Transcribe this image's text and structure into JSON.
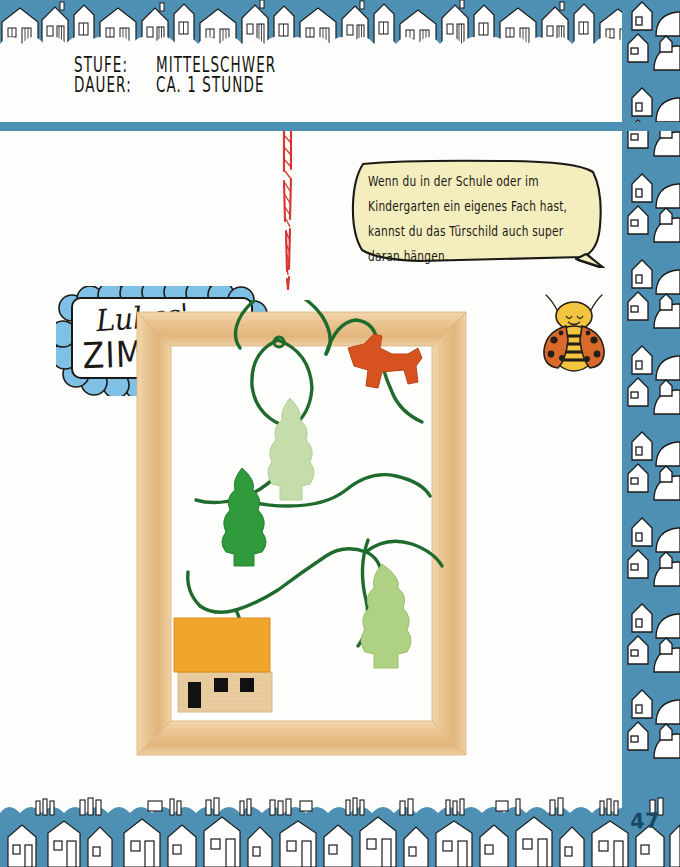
{
  "page": {
    "number": "47",
    "background_color": "#fdfdfb",
    "accent_blue": "#4e90b4",
    "accent_blue_dark": "#184a66"
  },
  "meta": {
    "rows": [
      {
        "label": "STUFE:",
        "value": "MITTELSCHWER"
      },
      {
        "label": "DAUER:",
        "value": "CA. 1 STUNDE"
      }
    ]
  },
  "speech_bubble": {
    "text": "Wenn du in der Schule oder im Kindergarten ein eigenes Fach hast, kannst du das Türschild auch super daran hängen.",
    "fill_color": "#f4edbe",
    "stroke_color": "#1c1a16"
  },
  "name_card": {
    "first_line": "Lukas'",
    "second_line": "ZIMMER",
    "card_color": "#ffffff",
    "scallop_color": "#7fc0e6",
    "scallop_outline": "#1c1a16"
  },
  "craft": {
    "frame_color": "#eac38f",
    "frame_color_light": "#f6dcb4",
    "wire_color": "#1f6b2e",
    "twine_colors": [
      "#d6342c",
      "#ffffff"
    ],
    "ornaments": [
      {
        "name": "tree-light-green-top",
        "color": "#bcd9a0",
        "shape": "tree"
      },
      {
        "name": "horse-orange",
        "color": "#d6521f",
        "shape": "horse"
      },
      {
        "name": "tree-dark-green",
        "color": "#2f9b3c",
        "shape": "tree"
      },
      {
        "name": "house-wood-orange-roof",
        "roof_color": "#f0a62c",
        "body_color": "#e8cfa4",
        "shape": "house"
      },
      {
        "name": "tree-light-green-bottom",
        "color": "#a8cd7f",
        "shape": "tree"
      }
    ]
  },
  "ladybug": {
    "head_color": "#f2c53f",
    "wing_color": "#d96a2b",
    "spot_color": "#241f1a",
    "stripe_color": "#f2c53f"
  },
  "borders": {
    "band_color": "#4e90b4",
    "house_color": "#ffffff",
    "outline_color": "#1b1b1b",
    "top_name": "house-border-top",
    "bottom_name": "house-border-bottom",
    "right_name": "house-border-right"
  }
}
